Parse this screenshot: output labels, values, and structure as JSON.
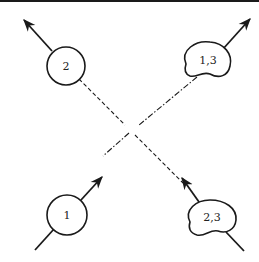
{
  "diagram": {
    "type": "scattering-cluster-diagram",
    "nodes": [
      {
        "id": "n2",
        "label": "2",
        "shape": "circle",
        "position": "top-left"
      },
      {
        "id": "n13",
        "label": "1,3",
        "shape": "blob",
        "position": "top-right"
      },
      {
        "id": "n1",
        "label": "1",
        "shape": "circle",
        "position": "bottom-left"
      },
      {
        "id": "n23",
        "label": "2,3",
        "shape": "blob",
        "position": "bottom-right"
      }
    ],
    "edges": [
      {
        "from": "n1",
        "to": "n13",
        "style": "dash-dot",
        "gap_at_center": true
      },
      {
        "from": "n23",
        "to": "n2",
        "style": "dashed",
        "gap_at_center": true
      }
    ],
    "arrows": [
      {
        "node": "n2",
        "direction": "outgoing-up-left"
      },
      {
        "node": "n13",
        "direction": "outgoing-up-right"
      },
      {
        "node": "n1",
        "direction": "incoming-from-lower-left, outgoing-up-right"
      },
      {
        "node": "n23",
        "direction": "incoming-from-lower-right, outgoing-up-left"
      }
    ],
    "colors": {
      "stroke": "#1a1a1a",
      "background": "#ffffff"
    }
  }
}
